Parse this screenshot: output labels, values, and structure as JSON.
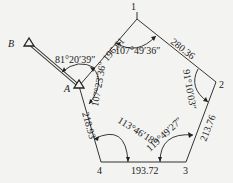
{
  "diagram": {
    "type": "closed traverse",
    "points": {
      "B": {
        "label": "B"
      },
      "A": {
        "label": "A"
      },
      "p1": {
        "label": "1"
      },
      "p2": {
        "label": "2"
      },
      "p3": {
        "label": "3"
      },
      "p4": {
        "label": "4"
      }
    },
    "distances": {
      "A_1": "196.61",
      "1_2": "280.36",
      "2_3": "213.76",
      "3_4": "193.72",
      "4_A": "218.93"
    },
    "angles": {
      "BA1": "81°20′39″",
      "at_1": "107°49′36″",
      "at_2": "91°10′03″",
      "at_3": "119°49′27″",
      "at_4": "113°46′18″",
      "at_A": "107°23′36″"
    },
    "colors": {
      "line": "#333333",
      "background": "#f3f3f1"
    }
  }
}
